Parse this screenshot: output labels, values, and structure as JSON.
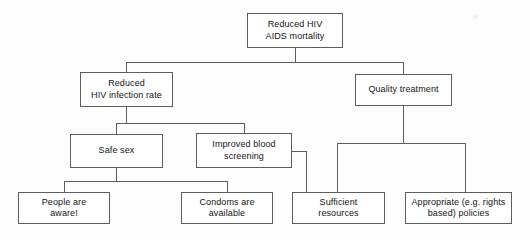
{
  "diagram": {
    "type": "objective-tree-flowchart",
    "style": {
      "background_color": "#fdfdfd",
      "box_fill_color": "#ffffff",
      "border_color": "#5d5d5d",
      "text_color": "#141414",
      "connector_color": "#5d5d5d"
    },
    "nodes": [
      {
        "id": "goal",
        "label": "Reduced HIV\nAIDS mortality",
        "level": 0,
        "x": 247,
        "y": 13,
        "w": 96,
        "h": 35
      },
      {
        "id": "reduced-infection",
        "label": "Reduced\nHIV infection rate",
        "level": 1,
        "x": 80,
        "y": 72,
        "w": 93,
        "h": 35
      },
      {
        "id": "quality-treatment",
        "label": "Quality treatment",
        "level": 1,
        "x": 355,
        "y": 74,
        "w": 97,
        "h": 32
      },
      {
        "id": "safe-sex",
        "label": "Safe sex",
        "level": 2,
        "x": 70,
        "y": 134,
        "w": 93,
        "h": 34
      },
      {
        "id": "improved-blood-screening",
        "label": "Improved blood\nscreening",
        "level": 2,
        "x": 196,
        "y": 133,
        "w": 96,
        "h": 35
      },
      {
        "id": "people-aware",
        "label": "People are\naware!",
        "level": 3,
        "x": 18,
        "y": 192,
        "w": 92,
        "h": 32
      },
      {
        "id": "condoms-available",
        "label": "Condoms are\navailable",
        "level": 3,
        "x": 181,
        "y": 192,
        "w": 92,
        "h": 32
      },
      {
        "id": "sufficient-resources",
        "label": "Sufficient\nresources",
        "level": 3,
        "x": 292,
        "y": 192,
        "w": 93,
        "h": 32
      },
      {
        "id": "appropriate-policies",
        "label": "Appropriate (e.g. rights\nbased) policies",
        "level": 3,
        "x": 405,
        "y": 192,
        "w": 107,
        "h": 32
      }
    ],
    "edges": [
      {
        "from": "goal",
        "to": "reduced-infection"
      },
      {
        "from": "goal",
        "to": "quality-treatment"
      },
      {
        "from": "reduced-infection",
        "to": "safe-sex"
      },
      {
        "from": "reduced-infection",
        "to": "improved-blood-screening"
      },
      {
        "from": "safe-sex",
        "to": "people-aware"
      },
      {
        "from": "safe-sex",
        "to": "condoms-available"
      },
      {
        "from": "improved-blood-screening",
        "to": "sufficient-resources"
      },
      {
        "from": "quality-treatment",
        "to": "sufficient-resources"
      },
      {
        "from": "quality-treatment",
        "to": "appropriate-policies"
      }
    ]
  }
}
